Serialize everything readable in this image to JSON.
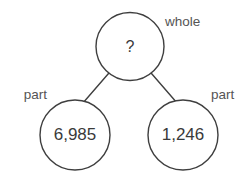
{
  "diagram": {
    "type": "number-bond",
    "background_color": "#ffffff",
    "stroke_color": "#3f3f3f",
    "text_color": "#3a3a3a",
    "label_color": "#555555",
    "whole": {
      "label": "whole",
      "value": "?",
      "is_unknown": true
    },
    "parts": [
      {
        "label": "part",
        "value": "6,985",
        "position": "left"
      },
      {
        "label": "part",
        "value": "1,246",
        "position": "right"
      }
    ]
  }
}
